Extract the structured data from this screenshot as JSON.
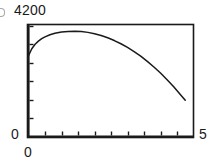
{
  "chart_data": {
    "type": "line",
    "title": "",
    "subtitle": "",
    "xlabel": "",
    "ylabel": "",
    "grid": false,
    "legend": null,
    "xlim": [
      0,
      5
    ],
    "ylim": [
      0,
      4200
    ],
    "x_tick_labels": [
      "0",
      "5"
    ],
    "y_tick_labels": [
      "0",
      "4200"
    ],
    "x_tick_count": 10,
    "y_tick_count": 6,
    "annotations": [],
    "series": [
      {
        "name": "curve",
        "color": "#1a1a1a",
        "x": [
          0.0,
          0.1,
          0.2,
          0.3,
          0.4,
          0.5,
          0.65,
          0.8,
          1.0,
          1.2,
          1.4,
          1.6,
          1.8,
          2.0,
          2.2,
          2.4,
          2.6,
          2.8,
          3.0,
          3.2,
          3.4,
          3.6,
          3.8,
          4.0,
          4.2,
          4.4,
          4.6,
          4.75
        ],
        "y": [
          3060,
          3320,
          3490,
          3610,
          3700,
          3770,
          3850,
          3905,
          3955,
          3975,
          3980,
          3970,
          3940,
          3890,
          3820,
          3735,
          3630,
          3510,
          3370,
          3215,
          3040,
          2845,
          2630,
          2400,
          2150,
          1880,
          1590,
          1370
        ]
      }
    ]
  },
  "labels": {
    "y_max": "4200",
    "y_min": "0",
    "x_min": "0",
    "x_max": "5"
  }
}
